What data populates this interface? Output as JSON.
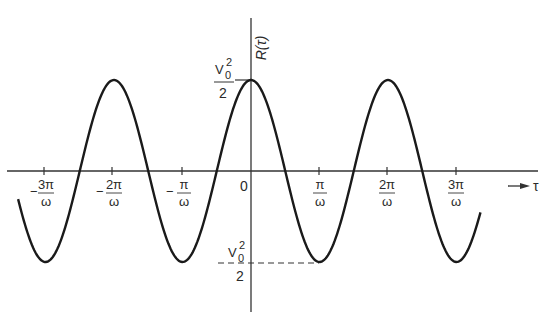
{
  "chart_data": {
    "type": "line",
    "title": "",
    "xlabel": "τ",
    "ylabel": "R(τ)",
    "function": "R(τ) = (V0²/2)·cos(ωτ)",
    "x_unit": "π/ω",
    "xlim": [
      -3.5,
      3.3
    ],
    "ylim": [
      -1,
      1
    ],
    "y_annotations": [
      {
        "label": "V0²/2",
        "value": 1,
        "position": "peak at τ=0"
      },
      {
        "label": "−V0²/2",
        "value": -1,
        "position": "trough at τ=π/ω",
        "dashed_guide": true
      }
    ],
    "x_ticks": [
      {
        "value": -3,
        "label": "−3π/ω",
        "sign": "−",
        "num": "3π",
        "den": "ω"
      },
      {
        "value": -2,
        "label": "−2π/ω",
        "sign": "−",
        "num": "2π",
        "den": "ω"
      },
      {
        "value": -1,
        "label": "−π/ω",
        "sign": "−",
        "num": "π",
        "den": "ω"
      },
      {
        "value": 0,
        "label": "0",
        "sign": "",
        "num": "0",
        "den": ""
      },
      {
        "value": 1,
        "label": "π/ω",
        "sign": "",
        "num": "π",
        "den": "ω"
      },
      {
        "value": 2,
        "label": "2π/ω",
        "sign": "",
        "num": "2π",
        "den": "ω"
      },
      {
        "value": 3,
        "label": "3π/ω",
        "sign": "",
        "num": "3π",
        "den": "ω"
      }
    ],
    "series": [
      {
        "name": "R(τ)",
        "x_in_pi_over_omega": [
          -3.4,
          -3,
          -2.5,
          -2,
          -1.5,
          -1,
          -0.5,
          0,
          0.5,
          1,
          1.5,
          2,
          2.5,
          3,
          3.35
        ],
        "y_normalized": [
          -0.81,
          -1,
          0,
          1,
          0,
          -1,
          0,
          1,
          0,
          -1,
          0,
          1,
          0,
          -1,
          -0.89
        ]
      }
    ],
    "grid": false,
    "legend": null
  },
  "labels": {
    "y_axis": "R(τ)",
    "x_axis": "τ",
    "x_arrow": "→",
    "peak_num": "V",
    "peak_sub": "0",
    "peak_sup": "2",
    "peak_den": "2",
    "trough_sign": "−",
    "trough_num": "V",
    "trough_sub": "0",
    "trough_sup": "2",
    "trough_den": "2",
    "tick_m3_sign": "−",
    "tick_m3_num": "3π",
    "tick_m3_den": "ω",
    "tick_m2_sign": "−",
    "tick_m2_num": "2π",
    "tick_m2_den": "ω",
    "tick_m1_sign": "−",
    "tick_m1_num": "π",
    "tick_m1_den": "ω",
    "tick_0": "0",
    "tick_p1_num": "π",
    "tick_p1_den": "ω",
    "tick_p2_num": "2π",
    "tick_p2_den": "ω",
    "tick_p3_num": "3π",
    "tick_p3_den": "ω"
  },
  "colors": {
    "curve": "#1a1a1a",
    "axis": "#333333",
    "text": "#2a2a2a"
  }
}
